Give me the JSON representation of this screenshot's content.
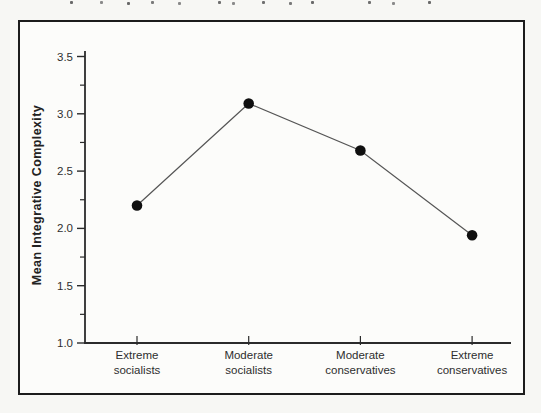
{
  "figure": {
    "panel": "boxed-chart-panel"
  },
  "chart_data": {
    "type": "line",
    "title": "",
    "categories": [
      [
        "Extreme",
        "socialists"
      ],
      [
        "Moderate",
        "socialists"
      ],
      [
        "Moderate",
        "conservatives"
      ],
      [
        "Extreme",
        "conservatives"
      ]
    ],
    "values": [
      2.2,
      3.09,
      2.68,
      1.94
    ],
    "xlabel": "",
    "ylabel": "Mean Integrative Complexity",
    "ylim": [
      1.0,
      3.5
    ],
    "yticks": [
      3.5,
      3.0,
      2.5,
      2.0,
      1.5,
      1.0
    ],
    "ytick_labels": [
      "3.5",
      "3.0",
      "2.5",
      "2.0",
      "1.5",
      "1.0"
    ],
    "minor_yticks": [
      3.25,
      2.75,
      2.25,
      1.75,
      1.25
    ],
    "grid": false,
    "legend": null,
    "marker": "filled-circle",
    "colors": {
      "line": "#555555",
      "marker": "#0f0f0f",
      "axis": "#2b2b2b",
      "tick_text": "#2e2e2e",
      "label_text": "#222222",
      "border": "#1c1c1c"
    }
  }
}
